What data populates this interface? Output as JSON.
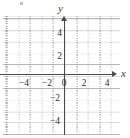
{
  "figure": {
    "kind": "cartesian-coordinate-grid",
    "axis_labels": {
      "x": "x",
      "y": "y"
    },
    "speck": ""
  },
  "chart_data": {
    "type": "scatter",
    "title": "",
    "subtitle": "",
    "xlabel": "x",
    "ylabel": "y",
    "xlim": [
      -5,
      5
    ],
    "ylim": [
      -5,
      5
    ],
    "xticks": [
      -4,
      -2,
      0,
      2,
      4
    ],
    "yticks": [
      -4,
      -2,
      2,
      4
    ],
    "xtick_labels": [
      "−4",
      "−2",
      "0",
      "2",
      "4"
    ],
    "ytick_labels": [
      "4",
      "2",
      "−2",
      "−4"
    ],
    "grid": true,
    "minor_grid_step": 1,
    "major_grid_step": 2,
    "legend": "none",
    "series": [
      {
        "name": "",
        "x": [],
        "y": []
      }
    ],
    "annotations": [],
    "axis_arrows": true,
    "colors": {
      "axis": "#4a4a4a",
      "major_grid": "#8c8c8c",
      "minor_grid": "#969696",
      "text": "#2e2e2e",
      "background": "#ffffff"
    }
  },
  "x_ticks": [
    {
      "label": "−4",
      "left": 16,
      "top": 79
    },
    {
      "label": "−2",
      "left": 39,
      "top": 79
    },
    {
      "label": "0",
      "top": 79,
      "left": 56
    },
    {
      "label": "2",
      "left": 76,
      "top": 79
    },
    {
      "label": "4",
      "left": 99,
      "top": 79
    }
  ],
  "y_ticks": [
    {
      "label": "4",
      "left": 46,
      "top": 29
    },
    {
      "label": "2",
      "left": 46,
      "top": 52
    },
    {
      "label": "−2",
      "left": 44,
      "top": 94
    },
    {
      "label": "−4",
      "left": 44,
      "top": 117
    }
  ]
}
